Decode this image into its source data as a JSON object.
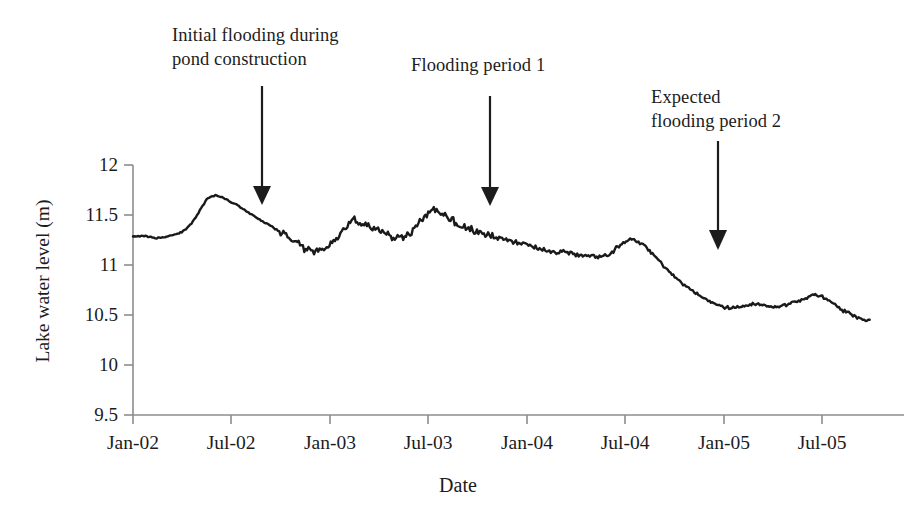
{
  "figure": {
    "background_color": "#ffffff",
    "line_color": "#1a1a1a",
    "axis_color": "#8a8a8a"
  },
  "axes": {
    "x_title": "Date",
    "y_title": "Lake water level (m)",
    "y_ticks": [
      "12",
      "11.5",
      "11",
      "10.5",
      "10",
      "9.5"
    ],
    "x_ticks": [
      "Jan-02",
      "Jul-02",
      "Jan-03",
      "Jul-03",
      "Jan-04",
      "Jul-04",
      "Jan-05",
      "Jul-05"
    ]
  },
  "annotations": [
    {
      "id": "initial-flooding",
      "text": "Initial flooding during\npond construction",
      "arrow_x_label": "Sep-02",
      "arrow_tip_value": 11.6
    },
    {
      "id": "flooding-period-1",
      "text": "Flooding period 1",
      "arrow_x_label": "Oct-03",
      "arrow_tip_value": 11.57
    },
    {
      "id": "expected-flooding-period-2",
      "text": "Expected\nflooding period 2",
      "arrow_x_label": "Nov-04",
      "arrow_tip_value": 11.1
    }
  ],
  "chart_data": {
    "type": "line",
    "title": "",
    "xlabel": "Date",
    "ylabel": "Lake water level (m)",
    "grid": false,
    "legend": "none",
    "xlim": [
      "Jan-02",
      "Oct-05"
    ],
    "ylim": [
      9.5,
      12
    ],
    "y_ticks": [
      9.5,
      10,
      10.5,
      11,
      11.5,
      12
    ],
    "x_ticks": [
      "Jan-02",
      "Jul-02",
      "Jan-03",
      "Jul-03",
      "Jan-04",
      "Jul-04",
      "Jan-05",
      "Jul-05"
    ],
    "x_unit": "month_index_from_Jan_2002",
    "series": [
      {
        "name": "Lake water level",
        "color": "#1a1a1a",
        "x": [
          0.0,
          0.5,
          1.0,
          1.5,
          2.0,
          2.5,
          3.0,
          3.5,
          4.0,
          4.5,
          5.0,
          5.5,
          6.0,
          6.5,
          7.0,
          7.5,
          8.0,
          8.5,
          9.0,
          9.5,
          10.0,
          10.5,
          11.0,
          11.5,
          12.0,
          12.5,
          13.0,
          13.5,
          14.0,
          14.5,
          15.0,
          15.5,
          16.0,
          16.5,
          17.0,
          17.5,
          18.0,
          18.5,
          19.0,
          19.5,
          20.0,
          20.5,
          21.0,
          21.5,
          22.0,
          22.5,
          23.0,
          23.5,
          24.0,
          24.5,
          25.0,
          25.5,
          26.0,
          26.5,
          27.0,
          27.5,
          28.0,
          28.5,
          29.0,
          29.5,
          30.0,
          30.5,
          31.0,
          31.5,
          32.0,
          32.5,
          33.0,
          33.5,
          34.0,
          34.5,
          35.0,
          35.5,
          36.0,
          36.5,
          37.0,
          37.5,
          38.0,
          38.5,
          39.0,
          39.5,
          40.0,
          40.5,
          41.0,
          41.5,
          42.0,
          42.5,
          43.0,
          43.5,
          44.0,
          44.5,
          45.0
        ],
        "y": [
          11.29,
          11.29,
          11.28,
          11.27,
          11.28,
          11.3,
          11.33,
          11.4,
          11.52,
          11.66,
          11.7,
          11.67,
          11.63,
          11.58,
          11.53,
          11.48,
          11.43,
          11.38,
          11.33,
          11.28,
          11.22,
          11.16,
          11.13,
          11.14,
          11.2,
          11.27,
          11.38,
          11.45,
          11.41,
          11.38,
          11.34,
          11.3,
          11.26,
          11.28,
          11.33,
          11.42,
          11.52,
          11.57,
          11.5,
          11.44,
          11.4,
          11.36,
          11.33,
          11.31,
          11.28,
          11.26,
          11.24,
          11.22,
          11.2,
          11.18,
          11.16,
          11.14,
          11.13,
          11.12,
          11.11,
          11.1,
          11.09,
          11.08,
          11.1,
          11.16,
          11.23,
          11.25,
          11.22,
          11.15,
          11.06,
          10.97,
          10.89,
          10.82,
          10.76,
          10.7,
          10.65,
          10.61,
          10.58,
          10.57,
          10.58,
          10.6,
          10.61,
          10.6,
          10.58,
          10.59,
          10.61,
          10.63,
          10.66,
          10.7,
          10.69,
          10.64,
          10.58,
          10.53,
          10.49,
          10.46,
          10.44
        ]
      }
    ],
    "features": [
      {
        "label": "initial peak",
        "x_label": "May-02",
        "value": 11.7
      },
      {
        "label": "local peak",
        "x_label": "Feb-03",
        "value": 11.47
      },
      {
        "label": "local peak",
        "x_label": "Jun-03",
        "value": 11.58
      },
      {
        "label": "local peak",
        "x_label": "Jun-04",
        "value": 11.25
      },
      {
        "label": "plateau low",
        "x_label": "Jan-05",
        "value": 10.57
      },
      {
        "label": "late peak",
        "x_label": "Jun-05",
        "value": 10.7
      },
      {
        "label": "series end",
        "x_label": "Oct-05",
        "value": 10.44
      }
    ]
  }
}
